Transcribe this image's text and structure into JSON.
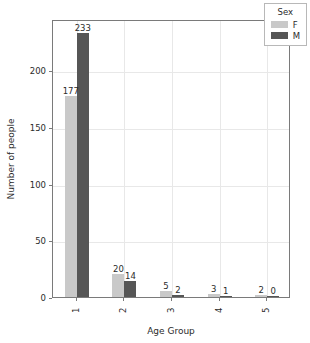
{
  "chart_data": {
    "type": "bar",
    "title": "",
    "xlabel": "Age Group",
    "ylabel": "Number of people",
    "categories": [
      "1",
      "2",
      "3",
      "4",
      "5"
    ],
    "series": [
      {
        "name": "F",
        "color": "#c9c9c9",
        "values": [
          177,
          20,
          5,
          3,
          2
        ]
      },
      {
        "name": "M",
        "color": "#565656",
        "values": [
          233,
          14,
          2,
          1,
          0
        ]
      }
    ],
    "ylim": [
      0,
      245
    ],
    "yticks": [
      0,
      50,
      100,
      150,
      200
    ],
    "ytick_labels": [
      "0",
      "50",
      "100",
      "150",
      "200"
    ],
    "xtick_labels": [
      "1",
      "2",
      "3",
      "4",
      "5"
    ],
    "grid": true,
    "legend": {
      "title": "Sex",
      "position": "upper right",
      "entries": [
        {
          "label": "F",
          "color": "#c9c9c9"
        },
        {
          "label": "M",
          "color": "#565656"
        }
      ]
    },
    "bar_value_labels": [
      {
        "group": "1",
        "series": "F",
        "value": "177"
      },
      {
        "group": "1",
        "series": "M",
        "value": "233"
      },
      {
        "group": "2",
        "series": "F",
        "value": "20"
      },
      {
        "group": "2",
        "series": "M",
        "value": "14"
      },
      {
        "group": "3",
        "series": "F",
        "value": "5"
      },
      {
        "group": "3",
        "series": "M",
        "value": "2"
      },
      {
        "group": "4",
        "series": "F",
        "value": "3"
      },
      {
        "group": "4",
        "series": "M",
        "value": "1"
      },
      {
        "group": "5",
        "series": "F",
        "value": "2"
      },
      {
        "group": "5",
        "series": "M",
        "value": "0"
      }
    ]
  }
}
